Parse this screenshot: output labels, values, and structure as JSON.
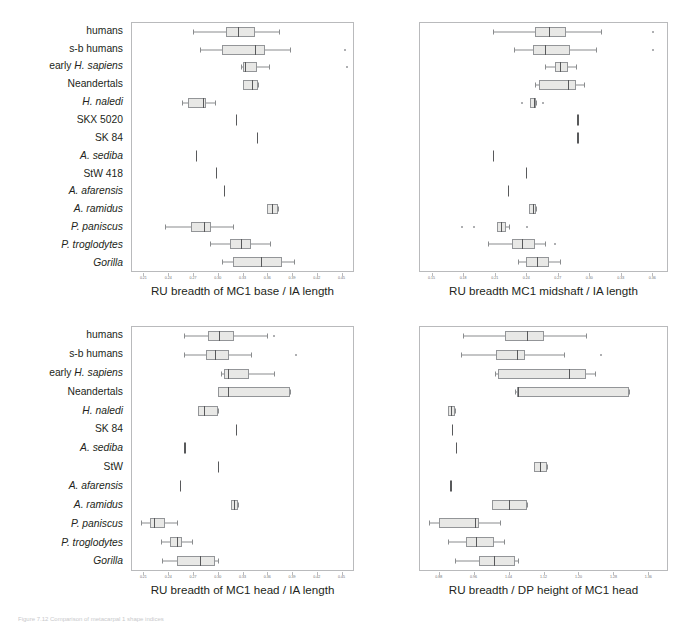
{
  "figure": {
    "caption_partial": "Figure 7.12 Comparison of metacarpal 1 shape indices",
    "categories_top": [
      "humans",
      "s-b humans",
      "early H. sapiens",
      "Neandertals",
      "H. naledi",
      "SKX 5020",
      "SK 84",
      "A. sediba",
      "StW 418",
      "A. afarensis",
      "A. ramidus",
      "P. paniscus",
      "P. troglodytes",
      "Gorilla"
    ],
    "categories_bottom": [
      "humans",
      "s-b humans",
      "early H. sapiens",
      "Neandertals",
      "H. naledi",
      "SK 84",
      "A. sediba",
      "StW",
      "A. afarensis",
      "A. ramidus",
      "P. paniscus",
      "P. troglodytes",
      "Gorilla"
    ],
    "box_fill": "#e8e8e6",
    "box_stroke": "#939598",
    "median_color": "#58595b",
    "axis_color": "#b9babc",
    "text_color": "#231f20"
  },
  "chart_data": [
    {
      "type": "box",
      "panel": "top-left",
      "title": "",
      "xlabel": "RU breadth of MC1 base / IA length",
      "ylabel": "",
      "xlim": [
        0.195,
        0.465
      ],
      "ticks": [
        0.21,
        0.24,
        0.27,
        0.3,
        0.33,
        0.36,
        0.39,
        0.42,
        0.45
      ],
      "ticklabels": [
        "0.21",
        "0.24",
        "0.27",
        "0.30",
        "0.33",
        "0.36",
        "0.39",
        "0.42",
        "0.45"
      ],
      "grid": false,
      "boxes": [
        {
          "category": "humans",
          "whislo": 0.27,
          "q1": 0.31,
          "med": 0.325,
          "q3": 0.345,
          "whishi": 0.375,
          "outliers": []
        },
        {
          "category": "s-b humans",
          "whislo": 0.278,
          "q1": 0.305,
          "med": 0.345,
          "q3": 0.358,
          "whishi": 0.388,
          "outliers": [
            0.455
          ]
        },
        {
          "category": "early H. sapiens",
          "whislo": 0.328,
          "q1": 0.33,
          "med": 0.333,
          "q3": 0.348,
          "whishi": 0.362,
          "outliers": [
            0.458
          ]
        },
        {
          "category": "Neandertals",
          "whislo": 0.33,
          "q1": 0.33,
          "med": 0.341,
          "q3": 0.349,
          "whishi": 0.349,
          "outliers": []
        },
        {
          "category": "H. naledi",
          "whislo": 0.256,
          "q1": 0.263,
          "med": 0.282,
          "q3": 0.285,
          "whishi": 0.296,
          "outliers": []
        },
        {
          "category": "SKX 5020",
          "single": 0.322
        },
        {
          "category": "SK 84",
          "single": 0.348
        },
        {
          "category": "A. sediba",
          "single": 0.273
        },
        {
          "category": "StW 418",
          "single": 0.298
        },
        {
          "category": "A. afarensis",
          "single": 0.307
        },
        {
          "category": "A. ramidus",
          "whislo": 0.36,
          "q1": 0.36,
          "med": 0.366,
          "q3": 0.373,
          "whishi": 0.373,
          "outliers": []
        },
        {
          "category": "P. paniscus",
          "whislo": 0.235,
          "q1": 0.267,
          "med": 0.283,
          "q3": 0.291,
          "whishi": 0.318,
          "outliers": []
        },
        {
          "category": "P. troglodytes",
          "whislo": 0.29,
          "q1": 0.315,
          "med": 0.328,
          "q3": 0.34,
          "whishi": 0.363,
          "outliers": []
        },
        {
          "category": "Gorilla",
          "whislo": 0.305,
          "q1": 0.318,
          "med": 0.353,
          "q3": 0.378,
          "whishi": 0.393,
          "outliers": []
        }
      ]
    },
    {
      "type": "box",
      "panel": "top-right",
      "title": "",
      "xlabel": "RU breadth MC1 midshaft / IA length",
      "ylabel": "",
      "xlim": [
        0.138,
        0.375
      ],
      "ticks": [
        0.15,
        0.18,
        0.21,
        0.24,
        0.27,
        0.3,
        0.33,
        0.36
      ],
      "ticklabels": [
        "0.15",
        "0.18",
        "0.21",
        "0.24",
        "0.27",
        "0.30",
        "0.33",
        "0.36"
      ],
      "grid": false,
      "boxes": [
        {
          "category": "humans",
          "whislo": 0.208,
          "q1": 0.248,
          "med": 0.262,
          "q3": 0.278,
          "whishi": 0.312,
          "outliers": [
            0.362
          ]
        },
        {
          "category": "s-b humans",
          "whislo": 0.228,
          "q1": 0.246,
          "med": 0.258,
          "q3": 0.282,
          "whishi": 0.307,
          "outliers": [
            0.362
          ]
        },
        {
          "category": "early H. sapiens",
          "whislo": 0.258,
          "q1": 0.268,
          "med": 0.272,
          "q3": 0.28,
          "whishi": 0.288,
          "outliers": []
        },
        {
          "category": "Neandertals",
          "whislo": 0.248,
          "q1": 0.252,
          "med": 0.28,
          "q3": 0.288,
          "whishi": 0.295,
          "outliers": []
        },
        {
          "category": "H. naledi",
          "whislo": 0.244,
          "q1": 0.244,
          "med": 0.247,
          "q3": 0.249,
          "whishi": 0.249,
          "outliers": [
            0.236,
            0.256
          ]
        },
        {
          "category": "SKX 5020",
          "single": 0.289
        },
        {
          "category": "SK 84",
          "single": 0.289
        },
        {
          "category": "A. sediba",
          "single": 0.208
        },
        {
          "category": "StW 418",
          "single": 0.24
        },
        {
          "category": "A. afarensis",
          "single": 0.222
        },
        {
          "category": "A. ramidus",
          "whislo": 0.243,
          "q1": 0.243,
          "med": 0.246,
          "q3": 0.249,
          "whishi": 0.249,
          "outliers": []
        },
        {
          "category": "P. paniscus",
          "whislo": 0.212,
          "q1": 0.212,
          "med": 0.216,
          "q3": 0.221,
          "whishi": 0.223,
          "outliers": [
            0.178,
            0.19,
            0.241
          ]
        },
        {
          "category": "P. troglodytes",
          "whislo": 0.203,
          "q1": 0.226,
          "med": 0.236,
          "q3": 0.248,
          "whishi": 0.258,
          "outliers": [
            0.268
          ]
        },
        {
          "category": "Gorilla",
          "whislo": 0.232,
          "q1": 0.24,
          "med": 0.25,
          "q3": 0.262,
          "whishi": 0.272,
          "outliers": []
        }
      ]
    },
    {
      "type": "box",
      "panel": "bottom-left",
      "title": "",
      "xlabel": "RU breadth of MC1 head / IA length",
      "ylabel": "",
      "xlim": [
        0.195,
        0.465
      ],
      "ticks": [
        0.21,
        0.24,
        0.27,
        0.3,
        0.33,
        0.36,
        0.39,
        0.42,
        0.45
      ],
      "ticklabels": [
        "0.21",
        "0.24",
        "0.27",
        "0.30",
        "0.33",
        "0.36",
        "0.39",
        "0.42",
        "0.45"
      ],
      "grid": false,
      "boxes": [
        {
          "category": "humans",
          "whislo": 0.258,
          "q1": 0.288,
          "med": 0.301,
          "q3": 0.32,
          "whishi": 0.36,
          "outliers": [
            0.368
          ]
        },
        {
          "category": "s-b humans",
          "whislo": 0.258,
          "q1": 0.285,
          "med": 0.297,
          "q3": 0.313,
          "whishi": 0.34,
          "outliers": [
            0.395
          ]
        },
        {
          "category": "early H. sapiens",
          "whislo": 0.304,
          "q1": 0.308,
          "med": 0.312,
          "q3": 0.338,
          "whishi": 0.368,
          "outliers": []
        },
        {
          "category": "Neandertals",
          "whislo": 0.3,
          "q1": 0.3,
          "med": 0.312,
          "q3": 0.388,
          "whishi": 0.388,
          "outliers": []
        },
        {
          "category": "H. naledi",
          "whislo": 0.276,
          "q1": 0.276,
          "med": 0.283,
          "q3": 0.3,
          "whishi": 0.3,
          "outliers": []
        },
        {
          "category": "SK 84",
          "single": 0.322
        },
        {
          "category": "A. sediba",
          "single": 0.259
        },
        {
          "category": "StW",
          "single": 0.3
        },
        {
          "category": "A. afarensis",
          "single": 0.254
        },
        {
          "category": "A. ramidus",
          "whislo": 0.316,
          "q1": 0.316,
          "med": 0.32,
          "q3": 0.324,
          "whishi": 0.324,
          "outliers": []
        },
        {
          "category": "P. paniscus",
          "whislo": 0.206,
          "q1": 0.217,
          "med": 0.222,
          "q3": 0.235,
          "whishi": 0.25,
          "outliers": []
        },
        {
          "category": "P. troglodytes",
          "whislo": 0.23,
          "q1": 0.242,
          "med": 0.25,
          "q3": 0.256,
          "whishi": 0.268,
          "outliers": []
        },
        {
          "category": "Gorilla",
          "whislo": 0.232,
          "q1": 0.25,
          "med": 0.278,
          "q3": 0.296,
          "whishi": 0.3,
          "outliers": []
        }
      ]
    },
    {
      "type": "box",
      "panel": "bottom-right",
      "title": "",
      "xlabel": "RU breadth / DP height of MC1 head",
      "ylabel": "",
      "xlim": [
        0.835,
        1.405
      ],
      "ticks": [
        0.88,
        0.96,
        1.04,
        1.12,
        1.2,
        1.28,
        1.36
      ],
      "ticklabels": [
        "0.88",
        "0.96",
        "1.04",
        "1.12",
        "1.20",
        "1.28",
        "1.36"
      ],
      "grid": false,
      "boxes": [
        {
          "category": "humans",
          "whislo": 0.935,
          "q1": 1.03,
          "med": 1.082,
          "q3": 1.122,
          "whishi": 1.218,
          "outliers": []
        },
        {
          "category": "s-b humans",
          "whislo": 0.93,
          "q1": 1.01,
          "med": 1.058,
          "q3": 1.078,
          "whishi": 1.168,
          "outliers": [
            1.252
          ]
        },
        {
          "category": "early H. sapiens",
          "whislo": 1.008,
          "q1": 1.015,
          "med": 1.178,
          "q3": 1.218,
          "whishi": 1.238,
          "outliers": []
        },
        {
          "category": "Neandertals",
          "whislo": 1.055,
          "q1": 1.058,
          "med": 1.062,
          "q3": 1.318,
          "whishi": 1.318,
          "outliers": []
        },
        {
          "category": "H. naledi",
          "whislo": 0.9,
          "q1": 0.9,
          "med": 0.906,
          "q3": 0.915,
          "whishi": 0.915,
          "outliers": []
        },
        {
          "category": "SK 84",
          "single": 0.908
        },
        {
          "category": "A. sediba",
          "single": 0.918
        },
        {
          "category": "StW",
          "whislo": 1.098,
          "q1": 1.098,
          "med": 1.112,
          "q3": 1.128,
          "whishi": 1.128,
          "outliers": []
        },
        {
          "category": "A. afarensis",
          "single": 0.905
        },
        {
          "category": "A. ramidus",
          "whislo": 1.0,
          "q1": 1.0,
          "med": 1.04,
          "q3": 1.082,
          "whishi": 1.082,
          "outliers": []
        },
        {
          "category": "P. paniscus",
          "whislo": 0.855,
          "q1": 0.878,
          "med": 0.962,
          "q3": 0.972,
          "whishi": 1.02,
          "outliers": []
        },
        {
          "category": "P. troglodytes",
          "whislo": 0.9,
          "q1": 0.942,
          "med": 0.965,
          "q3": 1.005,
          "whishi": 1.028,
          "outliers": []
        },
        {
          "category": "Gorilla",
          "whislo": 0.915,
          "q1": 0.972,
          "med": 1.005,
          "q3": 1.055,
          "whishi": 1.062,
          "outliers": []
        }
      ]
    }
  ]
}
